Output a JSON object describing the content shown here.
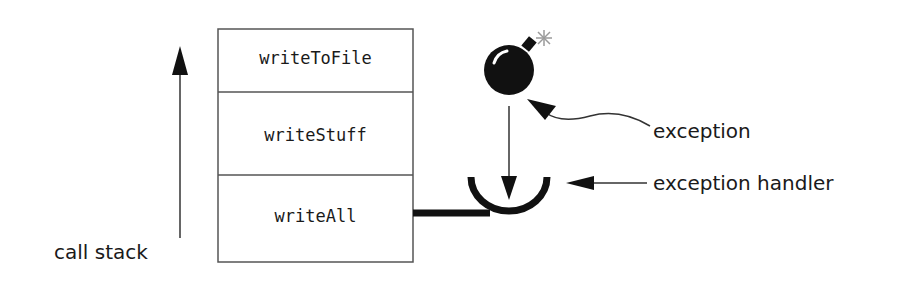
{
  "diagram": {
    "call_stack_label": "call stack",
    "frames": [
      {
        "label": "writeToFile"
      },
      {
        "label": "writeStuff"
      },
      {
        "label": "writeAll"
      }
    ],
    "exception_label": "exception",
    "handler_label": "exception handler",
    "colors": {
      "ink": "#111111",
      "box_border": "#555555",
      "spark": "#9a9a9a"
    }
  }
}
